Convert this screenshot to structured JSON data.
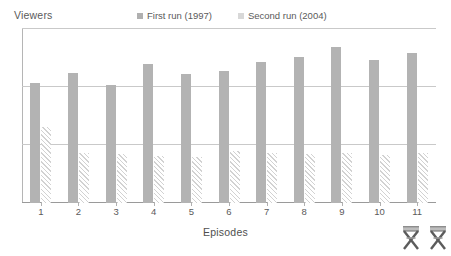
{
  "chart_data": {
    "type": "bar",
    "title": "",
    "ylabel": "Viewers",
    "xlabel": "Episodes",
    "categories": [
      "1",
      "2",
      "3",
      "4",
      "5",
      "6",
      "7",
      "8",
      "9",
      "10",
      "11"
    ],
    "series": [
      {
        "name": "First run (1997)",
        "color": "#b3b3b3",
        "values": [
          2.1,
          2.26,
          2.05,
          2.42,
          2.25,
          2.3,
          2.45,
          2.55,
          2.72,
          2.5,
          2.62
        ]
      },
      {
        "name": "Second run (2004)",
        "color": "#d2d2d2",
        "values": [
          1.33,
          0.88,
          0.85,
          0.82,
          0.8,
          0.9,
          0.87,
          0.86,
          0.88,
          0.84,
          0.88
        ]
      }
    ],
    "ylim": [
      0,
      3.05
    ],
    "yticks": [
      0,
      1,
      2,
      3
    ],
    "grid": true,
    "grid_axis": "y",
    "y_tick_labels_visible": false,
    "legend_position": "top"
  },
  "legend": {
    "items": [
      {
        "label": "First run (1997)",
        "swatch_color": "#b0b0b0"
      },
      {
        "label": "Second run (2004)",
        "swatch_color": "#d8d8d8"
      }
    ]
  },
  "axes": {
    "y_title": "Viewers",
    "x_title": "Episodes",
    "x_tick_labels": [
      "1",
      "2",
      "3",
      "4",
      "5",
      "6",
      "7",
      "8",
      "9",
      "10",
      "11"
    ]
  },
  "decorations": {
    "icons": [
      {
        "name": "director-chair-icon-1"
      },
      {
        "name": "director-chair-icon-2"
      }
    ]
  },
  "colors": {
    "first_run_bar": "#b3b3b3",
    "second_run_hatch": "#d2d2d2",
    "gridline": "#c9c9c9",
    "axis": "#9a9a9a",
    "text": "#5a5a5a",
    "background": "#ffffff"
  }
}
